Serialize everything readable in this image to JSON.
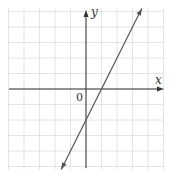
{
  "chart_data": {
    "type": "line",
    "title": "",
    "xlabel": "x",
    "ylabel": "y",
    "origin_label": "0",
    "grid": true,
    "xlim": [
      -5,
      5
    ],
    "ylim": [
      -5,
      5
    ],
    "series": [
      {
        "name": "line",
        "equation": "y = 2x - 2",
        "x": [
          -1.6,
          0,
          1,
          3.6
        ],
        "y": [
          -5.2,
          -2,
          0,
          5.2
        ],
        "arrows": "both"
      }
    ],
    "colors": {
      "line": "#555555",
      "grid": "#dddddd",
      "axis": "#333333"
    }
  }
}
